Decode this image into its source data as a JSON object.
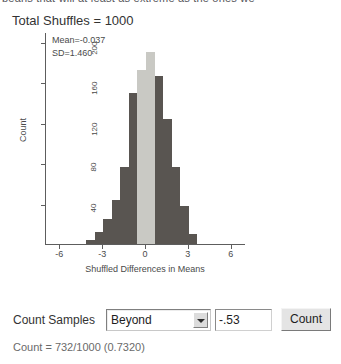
{
  "page": {
    "clipped_top_text": "beans that will at least as extreme as the ones we"
  },
  "header": {
    "title": "Total Shuffles = 1000"
  },
  "chart_data": {
    "type": "bar",
    "title": "Total Shuffles = 1000",
    "xlabel": "Shuffled Differences in Means",
    "ylabel": "Count",
    "xlim": [
      -7.0,
      7.0
    ],
    "ylim": [
      0,
      210
    ],
    "grid": false,
    "legend": null,
    "annotations": [
      "Mean=-0.037",
      "SD=1.460"
    ],
    "xticks": [
      -6,
      -3,
      0,
      3,
      6
    ],
    "xtick_labels": [
      "-6",
      "-3",
      "0",
      "3",
      "6"
    ],
    "yticks": [
      40,
      80,
      120,
      160,
      200
    ],
    "ytick_labels": [
      "40",
      "80",
      "120",
      "160",
      "200"
    ],
    "bin_width": 0.6,
    "bin_centers": [
      -3.9,
      -3.3,
      -2.7,
      -2.1,
      -1.5,
      -0.9,
      -0.3,
      0.3,
      0.9,
      1.5,
      2.1,
      2.7,
      3.3
    ],
    "values": [
      4,
      12,
      25,
      44,
      76,
      150,
      172,
      190,
      166,
      124,
      76,
      38,
      10
    ],
    "bar_colors": [
      "#595551",
      "#595551",
      "#595551",
      "#595551",
      "#595551",
      "#595551",
      "#c9c9c4",
      "#c9c9c4",
      "#595551",
      "#595551",
      "#595551",
      "#595551",
      "#595551"
    ],
    "highlight_color": "#c9c9c4",
    "bar_color": "#595551",
    "axis_color": "#5d5d5d"
  },
  "stats": {
    "mean_label": "Mean=-0.037",
    "sd_label": "SD=1.460"
  },
  "controls": {
    "count_samples_label": "Count Samples",
    "range_select": {
      "value": "Beyond",
      "options": [
        "Beyond",
        "Between",
        "Below",
        "Above"
      ]
    },
    "cutoff_field": {
      "value": "-.53",
      "placeholder": ""
    },
    "count_button_label": "Count"
  },
  "result": {
    "text": "Count = 732/1000 (0.7320)",
    "count": 732,
    "total": 1000,
    "proportion": "0.7320"
  }
}
